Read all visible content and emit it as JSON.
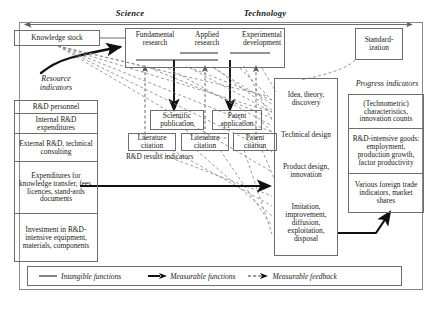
{
  "header": {
    "science_label": "Science",
    "technology_label": "Technology"
  },
  "knowledge_stock": {
    "label": "Knowledge stock"
  },
  "resource_indicators": {
    "title_line1": "Resource",
    "title_line2": "indicators",
    "items": [
      "R&D personnel",
      "Internal R&D expenditures",
      "External R&D, technical consulting",
      "Expenditures for knowledge transfer, fees, licences, stand-ards documents",
      "Investment in R&D-intensive equipment, materials, components"
    ]
  },
  "top_row": {
    "boxes": [
      "Fundamental research",
      "Applied research",
      "Experimental development"
    ],
    "standardization": "Standard-ization"
  },
  "results": {
    "caption": "R&D results indicators",
    "upper": [
      "Scientific publication",
      "Patent application"
    ],
    "lower": [
      "Literature citation",
      "Literature citation",
      "Patent citation"
    ]
  },
  "process_column": {
    "items": [
      "Idea, theory, discovery",
      "Technical design",
      "Product design, innovation",
      "Imitation, improvement, diffusion, exploitation, disposal"
    ]
  },
  "progress_indicators": {
    "title": "Progress indicators",
    "items": [
      "(Technometric) characteristics, innovation counts",
      "R&D-intensive goods: employment, production growth, factor productivity",
      "Various foreign trade indicators, market shares"
    ]
  },
  "legend": {
    "items": [
      {
        "marker": "solid-line",
        "label": "Intangible functions"
      },
      {
        "marker": "solid-arrow",
        "label": "Measurable functions"
      },
      {
        "marker": "dashed-arrow",
        "label": "Measurable feedback"
      }
    ]
  },
  "colors": {
    "stroke": "#6d6d6d",
    "text": "#1a1a1a",
    "arrow_solid": "#111111",
    "arrow_dashed": "#777777"
  }
}
